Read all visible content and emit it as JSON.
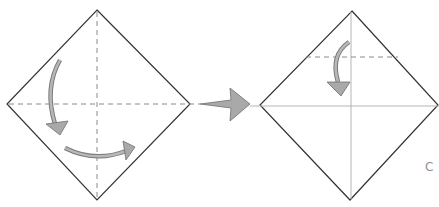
{
  "diagram": {
    "type": "origami-instructions",
    "steps": [
      {
        "name": "step-1",
        "description": "Square paper as diamond with vertical and horizontal valley-fold dashed lines; curved arrows indicating folds",
        "fold_lines": [
          "vertical-dashed",
          "horizontal-dashed"
        ],
        "arrows": [
          "curved-down-arrow",
          "curved-right-arrow"
        ]
      },
      {
        "name": "transition",
        "arrow": "next-step-arrow"
      },
      {
        "name": "step-2",
        "description": "Diamond with creased diagonals (solid light lines) and a horizontal dashed fold line near the top; curved arrow folding the top point down",
        "fold_lines": [
          "vertical-crease",
          "horizontal-crease",
          "top-horizontal-dashed"
        ],
        "arrows": [
          "curved-down-arrow"
        ]
      }
    ],
    "partial_label": "C",
    "colors": {
      "outline": "#333333",
      "dashed": "#8a8a8a",
      "crease": "#b5b5b5",
      "arrow": "#a9a9a9"
    }
  }
}
